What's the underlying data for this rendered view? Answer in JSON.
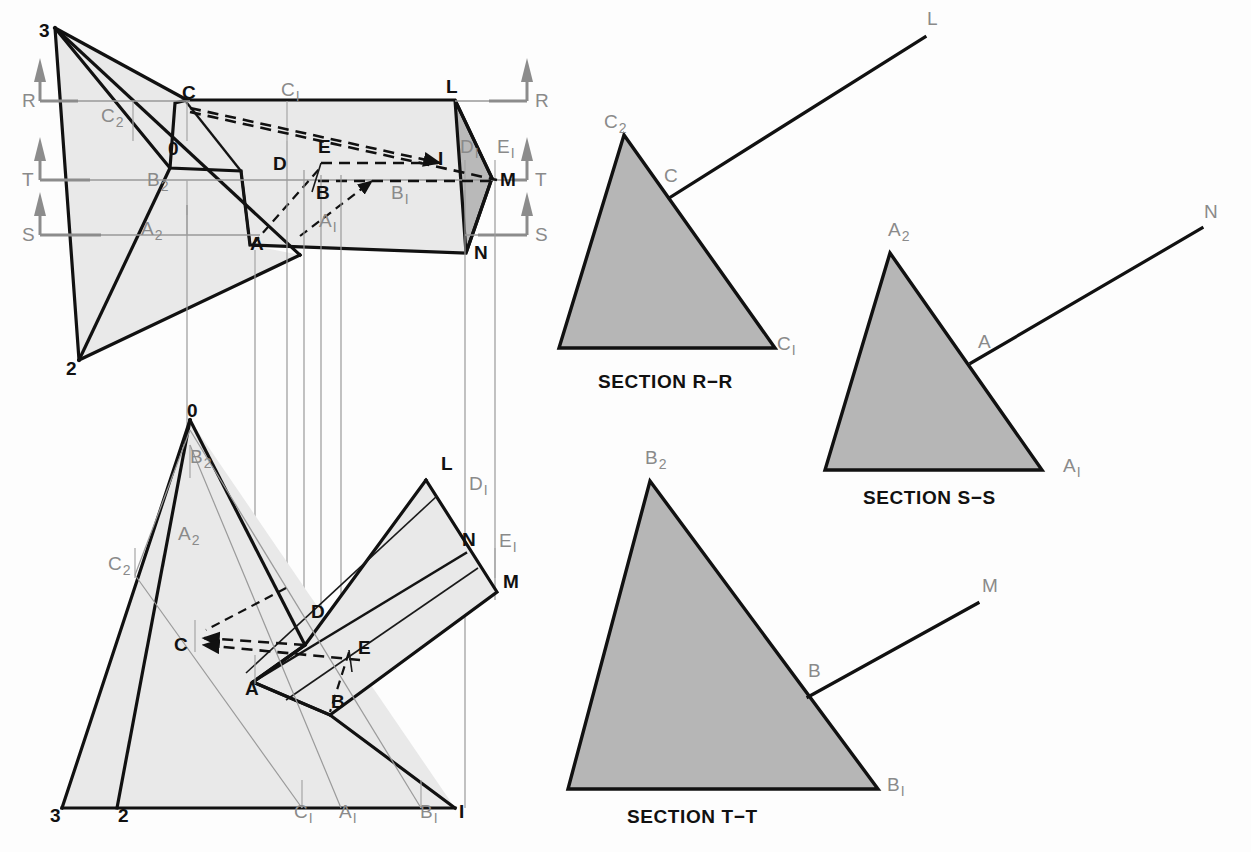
{
  "figure": {
    "background_color": "#ffffff",
    "colors": {
      "outline": "#111111",
      "face_light_gray": "#e9e9e9",
      "face_mid_gray": "#b9b9b9",
      "section_gray": "#b6b6b6",
      "reference_gray": "#999999",
      "cut_mark_gray": "#8c8c8c",
      "label_black": "#111111",
      "label_gray": "#8a8a8a"
    }
  },
  "top_view": {
    "name": "top-view",
    "pyramid_apex_labels": [
      {
        "id": "v3",
        "text": "3",
        "style": "black",
        "x": 39,
        "y": 37
      },
      {
        "id": "v2",
        "text": "2",
        "style": "black",
        "x": 66,
        "y": 375
      },
      {
        "id": "v0",
        "text": "0",
        "style": "black",
        "x": 168,
        "y": 155
      }
    ],
    "point_labels": [
      {
        "id": "C",
        "text": "C",
        "sub": "",
        "style": "black",
        "x": 182,
        "y": 99
      },
      {
        "id": "C1",
        "text": "C",
        "sub": "1",
        "style": "gray",
        "x": 281,
        "y": 96
      },
      {
        "id": "C2",
        "text": "C",
        "sub": "2",
        "style": "gray",
        "x": 101,
        "y": 122
      },
      {
        "id": "L",
        "text": "L",
        "sub": "",
        "style": "black",
        "x": 446,
        "y": 93
      },
      {
        "id": "D",
        "text": "D",
        "sub": "",
        "style": "black",
        "x": 273,
        "y": 170
      },
      {
        "id": "E",
        "text": "E",
        "sub": "",
        "style": "black",
        "x": 318,
        "y": 153
      },
      {
        "id": "I",
        "text": "I",
        "sub": "",
        "style": "black",
        "x": 438,
        "y": 165
      },
      {
        "id": "D1",
        "text": "D",
        "sub": "1",
        "style": "gray",
        "x": 460,
        "y": 153
      },
      {
        "id": "E1",
        "text": "E",
        "sub": "1",
        "style": "gray",
        "x": 497,
        "y": 153
      },
      {
        "id": "B2",
        "text": "B",
        "sub": "2",
        "style": "gray",
        "x": 147,
        "y": 186
      },
      {
        "id": "B",
        "text": "B",
        "sub": "",
        "style": "black",
        "x": 316,
        "y": 199
      },
      {
        "id": "B1",
        "text": "B",
        "sub": "1",
        "style": "gray",
        "x": 391,
        "y": 199
      },
      {
        "id": "M",
        "text": "M",
        "sub": "",
        "style": "black",
        "x": 500,
        "y": 186
      },
      {
        "id": "A2",
        "text": "A",
        "sub": "2",
        "style": "gray",
        "x": 141,
        "y": 235
      },
      {
        "id": "A1",
        "text": "A",
        "sub": "1",
        "style": "gray",
        "x": 319,
        "y": 227
      },
      {
        "id": "A",
        "text": "A",
        "sub": "",
        "style": "black",
        "x": 250,
        "y": 250
      },
      {
        "id": "N",
        "text": "N",
        "sub": "",
        "style": "black",
        "x": 474,
        "y": 259
      }
    ],
    "cutting_planes_left": [
      {
        "id": "R",
        "label": "R",
        "x": 22,
        "y": 101
      },
      {
        "id": "T",
        "label": "T",
        "x": 22,
        "y": 174
      },
      {
        "id": "S",
        "label": "S",
        "x": 22,
        "y": 231
      }
    ],
    "cutting_planes_right": [
      {
        "id": "R",
        "label": "R",
        "x": 535,
        "y": 101
      },
      {
        "id": "T",
        "label": "T",
        "x": 535,
        "y": 174
      },
      {
        "id": "S",
        "label": "S",
        "x": 535,
        "y": 231
      }
    ]
  },
  "front_view": {
    "name": "front-view",
    "point_labels": [
      {
        "id": "O",
        "text": "0",
        "sub": "",
        "style": "black",
        "x": 187,
        "y": 417
      },
      {
        "id": "B2",
        "text": "B",
        "sub": "2",
        "style": "gray",
        "x": 190,
        "y": 463
      },
      {
        "id": "A2",
        "text": "A",
        "sub": "2",
        "style": "gray",
        "x": 178,
        "y": 540
      },
      {
        "id": "C2",
        "text": "C",
        "sub": "2",
        "style": "gray",
        "x": 108,
        "y": 570
      },
      {
        "id": "L",
        "text": "L",
        "sub": "",
        "style": "black",
        "x": 441,
        "y": 470
      },
      {
        "id": "D1",
        "text": "D",
        "sub": "1",
        "style": "gray",
        "x": 469,
        "y": 490
      },
      {
        "id": "N",
        "text": "N",
        "sub": "",
        "style": "black",
        "x": 462,
        "y": 546
      },
      {
        "id": "E1",
        "text": "E",
        "sub": "1",
        "style": "gray",
        "x": 499,
        "y": 547
      },
      {
        "id": "M",
        "text": "M",
        "sub": "",
        "style": "black",
        "x": 503,
        "y": 588
      },
      {
        "id": "D",
        "text": "D",
        "sub": "",
        "style": "black",
        "x": 311,
        "y": 618
      },
      {
        "id": "C",
        "text": "C",
        "sub": "",
        "style": "black",
        "x": 174,
        "y": 651
      },
      {
        "id": "E",
        "text": "E",
        "sub": "",
        "style": "black",
        "x": 358,
        "y": 654
      },
      {
        "id": "A",
        "text": "A",
        "sub": "",
        "style": "black",
        "x": 245,
        "y": 695
      },
      {
        "id": "B",
        "text": "B",
        "sub": "",
        "style": "black",
        "x": 331,
        "y": 708
      },
      {
        "id": "v3",
        "text": "3",
        "sub": "",
        "style": "black",
        "x": 50,
        "y": 822
      },
      {
        "id": "v2",
        "text": "2",
        "sub": "",
        "style": "black",
        "x": 118,
        "y": 822
      },
      {
        "id": "C1",
        "text": "C",
        "sub": "1",
        "style": "gray",
        "x": 294,
        "y": 818
      },
      {
        "id": "A1",
        "text": "A",
        "sub": "1",
        "style": "gray",
        "x": 339,
        "y": 818
      },
      {
        "id": "B1",
        "text": "B",
        "sub": "1",
        "style": "gray",
        "x": 420,
        "y": 818
      },
      {
        "id": "I",
        "text": "I",
        "sub": "",
        "style": "black",
        "x": 459,
        "y": 818
      }
    ]
  },
  "sections": [
    {
      "id": "section-r-r",
      "title": "SECTION R−R",
      "title_x": 598,
      "title_y": 388,
      "vertices": {
        "apex": "C2",
        "bottom_right": "C1",
        "bottom_left": ""
      },
      "labels": [
        {
          "id": "C2",
          "text": "C",
          "sub": "2",
          "style": "gray",
          "x": 604,
          "y": 128
        },
        {
          "id": "C",
          "text": "C",
          "sub": "",
          "style": "gray",
          "x": 664,
          "y": 182
        },
        {
          "id": "C1",
          "text": "C",
          "sub": "1",
          "style": "gray",
          "x": 777,
          "y": 350
        },
        {
          "id": "L",
          "text": "L",
          "sub": "",
          "style": "gray",
          "x": 927,
          "y": 25
        }
      ]
    },
    {
      "id": "section-s-s",
      "title": "SECTION S−S",
      "title_x": 863,
      "title_y": 504,
      "vertices": {
        "apex": "A2",
        "bottom_right": "A1",
        "bottom_left": ""
      },
      "labels": [
        {
          "id": "A2",
          "text": "A",
          "sub": "2",
          "style": "gray",
          "x": 888,
          "y": 236
        },
        {
          "id": "A",
          "text": "A",
          "sub": "",
          "style": "gray",
          "x": 978,
          "y": 348
        },
        {
          "id": "A1",
          "text": "A",
          "sub": "1",
          "style": "gray",
          "x": 1063,
          "y": 472
        },
        {
          "id": "N",
          "text": "N",
          "sub": "",
          "style": "gray",
          "x": 1204,
          "y": 218
        }
      ]
    },
    {
      "id": "section-t-t",
      "title": "SECTION T−T",
      "title_x": 627,
      "title_y": 823,
      "vertices": {
        "apex": "B2",
        "bottom_right": "B1",
        "bottom_left": ""
      },
      "labels": [
        {
          "id": "B2",
          "text": "B",
          "sub": "2",
          "style": "gray",
          "x": 645,
          "y": 464
        },
        {
          "id": "B",
          "text": "B",
          "sub": "",
          "style": "gray",
          "x": 808,
          "y": 677
        },
        {
          "id": "B1",
          "text": "B",
          "sub": "1",
          "style": "gray",
          "x": 887,
          "y": 791
        },
        {
          "id": "M",
          "text": "M",
          "sub": "",
          "style": "gray",
          "x": 982,
          "y": 592
        }
      ]
    }
  ],
  "chart_data": {
    "type": "diagram",
    "views": [
      "top view",
      "front view",
      "SECTION R−R",
      "SECTION S−S",
      "SECTION T−T"
    ],
    "named_points": [
      "0",
      "1",
      "2",
      "3",
      "A",
      "B",
      "C",
      "D",
      "E",
      "I",
      "L",
      "M",
      "N",
      "A1",
      "B1",
      "C1",
      "D1",
      "E1",
      "A2",
      "B2",
      "C2"
    ],
    "cutting_plane_labels": [
      "R",
      "S",
      "T"
    ]
  }
}
